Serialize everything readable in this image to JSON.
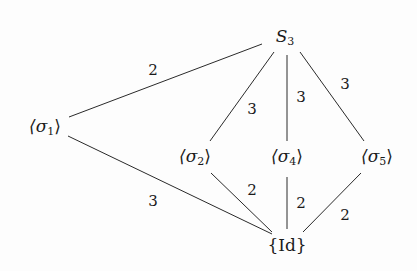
{
  "diagram": {
    "nodes": [
      {
        "id": "S3",
        "base": "S",
        "sub": "3",
        "x": 285,
        "y": 37
      },
      {
        "id": "s1",
        "base": "⟨σ",
        "sub": "1",
        "close": "⟩",
        "x": 45,
        "y": 127
      },
      {
        "id": "s2",
        "base": "⟨σ",
        "sub": "2",
        "close": "⟩",
        "x": 195,
        "y": 157
      },
      {
        "id": "s4",
        "base": "⟨σ",
        "sub": "4",
        "close": "⟩",
        "x": 287,
        "y": 157
      },
      {
        "id": "s5",
        "base": "⟨σ",
        "sub": "5",
        "close": "⟩",
        "x": 377,
        "y": 157
      },
      {
        "id": "Id",
        "base": "{Id}",
        "sub": "",
        "close": "",
        "x": 287,
        "y": 245
      }
    ],
    "edges": [
      {
        "from": "S3",
        "to": "s1",
        "label": "2",
        "x1": 262,
        "y1": 44,
        "x2": 69,
        "y2": 117,
        "lx": 153,
        "ly": 70
      },
      {
        "from": "S3",
        "to": "s2",
        "label": "3",
        "x1": 274,
        "y1": 52,
        "x2": 210,
        "y2": 141,
        "lx": 252,
        "ly": 109
      },
      {
        "from": "S3",
        "to": "s4",
        "label": "3",
        "x1": 287,
        "y1": 55,
        "x2": 287,
        "y2": 141,
        "lx": 301,
        "ly": 97
      },
      {
        "from": "S3",
        "to": "s5",
        "label": "3",
        "x1": 300,
        "y1": 52,
        "x2": 364,
        "y2": 141,
        "lx": 345,
        "ly": 84
      },
      {
        "from": "s1",
        "to": "Id",
        "label": "3",
        "x1": 68,
        "y1": 136,
        "x2": 272,
        "y2": 234,
        "lx": 153,
        "ly": 201
      },
      {
        "from": "s2",
        "to": "Id",
        "label": "2",
        "x1": 211,
        "y1": 173,
        "x2": 272,
        "y2": 232,
        "lx": 252,
        "ly": 190
      },
      {
        "from": "s4",
        "to": "Id",
        "label": "2",
        "x1": 287,
        "y1": 177,
        "x2": 287,
        "y2": 229,
        "lx": 301,
        "ly": 203
      },
      {
        "from": "s5",
        "to": "Id",
        "label": "2",
        "x1": 361,
        "y1": 173,
        "x2": 303,
        "y2": 232,
        "lx": 345,
        "ly": 215
      }
    ]
  }
}
